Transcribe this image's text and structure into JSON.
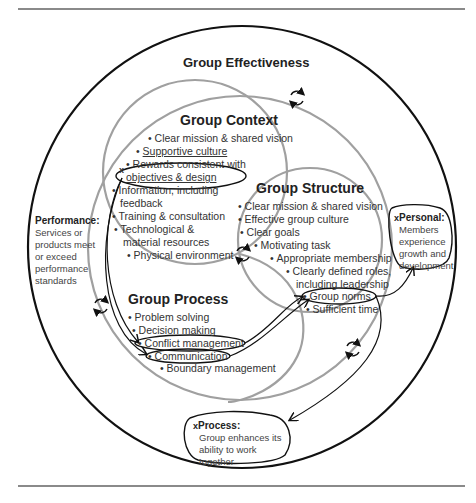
{
  "title": "Group Effectiveness",
  "colors": {
    "outer_circle": "#111111",
    "inner_circles": "#a0a0a0",
    "rule": "#8a8a8a",
    "text": "#333333"
  },
  "group_context": {
    "heading": "Group Context",
    "items": [
      "Clear mission & shared vision",
      "Supportive culture",
      "Rewards consistent with",
      "objectives & design",
      "Information, including",
      "feedback",
      "Training & consultation",
      "Technological &",
      "material resources",
      "Physical environment"
    ]
  },
  "group_structure": {
    "heading": "Group Structure",
    "items": [
      "Clear mission & shared vision",
      "Effective group culture",
      "Clear goals",
      "Motivating task",
      "Appropriate membership",
      "Clearly defined roles,",
      "including leadership",
      "Group norms",
      "Sufficient time"
    ]
  },
  "group_process": {
    "heading": "Group Process",
    "items": [
      "Problem solving",
      "Decision making",
      "Conflict management",
      "Communication",
      "Boundary management"
    ]
  },
  "outcomes": {
    "performance": {
      "label": "Performance:",
      "lines": [
        "Services or",
        "products meet",
        "or exceed",
        "performance",
        "standards"
      ]
    },
    "personal": {
      "label": "Personal:",
      "lines": [
        "Members",
        "experience",
        "growth and",
        "development"
      ]
    },
    "process": {
      "label": "Process:",
      "lines": [
        "Group enhances its",
        "ability to work together"
      ]
    }
  },
  "icons": {
    "cycle": "cycle-arrows-icon",
    "marker": "x"
  }
}
